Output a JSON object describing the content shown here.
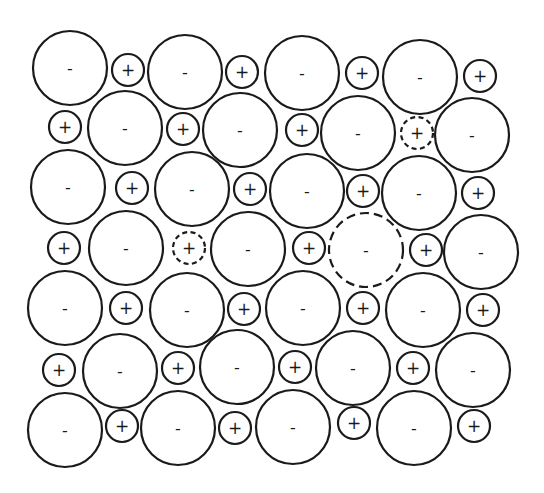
{
  "diagram": {
    "stroke_color": "#1a1a1a",
    "background": "#ffffff",
    "labels": {
      "anion": "-",
      "cation": "+"
    },
    "radii": {
      "anion": 37,
      "cation": 16
    },
    "ions": [
      {
        "x": 70,
        "y": 68,
        "type": "anion",
        "label": "-",
        "vacancy": false
      },
      {
        "x": 128,
        "y": 70,
        "type": "cation",
        "label": "+",
        "vacancy": false
      },
      {
        "x": 185,
        "y": 72,
        "type": "anion",
        "label": "-",
        "vacancy": false
      },
      {
        "x": 242,
        "y": 72,
        "type": "cation",
        "label": "+",
        "vacancy": false
      },
      {
        "x": 302,
        "y": 73,
        "type": "anion",
        "label": "-",
        "vacancy": false
      },
      {
        "x": 362,
        "y": 73,
        "type": "cation",
        "label": "+",
        "vacancy": false
      },
      {
        "x": 420,
        "y": 77,
        "type": "anion",
        "label": "-",
        "vacancy": false
      },
      {
        "x": 480,
        "y": 76,
        "type": "cation",
        "label": "+",
        "vacancy": false
      },
      {
        "x": 65,
        "y": 127,
        "type": "cation",
        "label": "+",
        "vacancy": false
      },
      {
        "x": 125,
        "y": 128,
        "type": "anion",
        "label": "-",
        "vacancy": false
      },
      {
        "x": 183,
        "y": 129,
        "type": "cation",
        "label": "+",
        "vacancy": false
      },
      {
        "x": 240,
        "y": 130,
        "type": "anion",
        "label": "-",
        "vacancy": false
      },
      {
        "x": 302,
        "y": 130,
        "type": "cation",
        "label": "+",
        "vacancy": false
      },
      {
        "x": 358,
        "y": 133,
        "type": "anion",
        "label": "-",
        "vacancy": false
      },
      {
        "x": 417,
        "y": 133,
        "type": "cation",
        "label": "+",
        "vacancy": true
      },
      {
        "x": 472,
        "y": 135,
        "type": "anion",
        "label": "-",
        "vacancy": false
      },
      {
        "x": 68,
        "y": 187,
        "type": "anion",
        "label": "-",
        "vacancy": false
      },
      {
        "x": 132,
        "y": 188,
        "type": "cation",
        "label": "+",
        "vacancy": false
      },
      {
        "x": 192,
        "y": 189,
        "type": "anion",
        "label": "-",
        "vacancy": false
      },
      {
        "x": 250,
        "y": 189,
        "type": "cation",
        "label": "+",
        "vacancy": false
      },
      {
        "x": 307,
        "y": 191,
        "type": "anion",
        "label": "-",
        "vacancy": false
      },
      {
        "x": 363,
        "y": 191,
        "type": "cation",
        "label": "+",
        "vacancy": false
      },
      {
        "x": 419,
        "y": 193,
        "type": "anion",
        "label": "-",
        "vacancy": false
      },
      {
        "x": 478,
        "y": 193,
        "type": "cation",
        "label": "+",
        "vacancy": false
      },
      {
        "x": 64,
        "y": 248,
        "type": "cation",
        "label": "+",
        "vacancy": false
      },
      {
        "x": 126,
        "y": 248,
        "type": "anion",
        "label": "-",
        "vacancy": false
      },
      {
        "x": 189,
        "y": 248,
        "type": "cation",
        "label": "+",
        "vacancy": true
      },
      {
        "x": 248,
        "y": 249,
        "type": "anion",
        "label": "-",
        "vacancy": false
      },
      {
        "x": 309,
        "y": 248,
        "type": "cation",
        "label": "+",
        "vacancy": false
      },
      {
        "x": 366,
        "y": 250,
        "type": "anion",
        "label": "-",
        "vacancy": true
      },
      {
        "x": 426,
        "y": 250,
        "type": "cation",
        "label": "+",
        "vacancy": false
      },
      {
        "x": 481,
        "y": 252,
        "type": "anion",
        "label": "-",
        "vacancy": false
      },
      {
        "x": 65,
        "y": 308,
        "type": "anion",
        "label": "-",
        "vacancy": false
      },
      {
        "x": 126,
        "y": 308,
        "type": "cation",
        "label": "+",
        "vacancy": false
      },
      {
        "x": 187,
        "y": 310,
        "type": "anion",
        "label": "-",
        "vacancy": false
      },
      {
        "x": 244,
        "y": 309,
        "type": "cation",
        "label": "+",
        "vacancy": false
      },
      {
        "x": 303,
        "y": 308,
        "type": "anion",
        "label": "-",
        "vacancy": false
      },
      {
        "x": 363,
        "y": 308,
        "type": "cation",
        "label": "+",
        "vacancy": false
      },
      {
        "x": 423,
        "y": 310,
        "type": "anion",
        "label": "-",
        "vacancy": false
      },
      {
        "x": 483,
        "y": 310,
        "type": "cation",
        "label": "+",
        "vacancy": false
      },
      {
        "x": 59,
        "y": 370,
        "type": "cation",
        "label": "+",
        "vacancy": false
      },
      {
        "x": 120,
        "y": 371,
        "type": "anion",
        "label": "-",
        "vacancy": false
      },
      {
        "x": 178,
        "y": 368,
        "type": "cation",
        "label": "+",
        "vacancy": false
      },
      {
        "x": 237,
        "y": 367,
        "type": "anion",
        "label": "-",
        "vacancy": false
      },
      {
        "x": 295,
        "y": 367,
        "type": "cation",
        "label": "+",
        "vacancy": false
      },
      {
        "x": 353,
        "y": 368,
        "type": "anion",
        "label": "-",
        "vacancy": false
      },
      {
        "x": 413,
        "y": 368,
        "type": "cation",
        "label": "+",
        "vacancy": false
      },
      {
        "x": 473,
        "y": 370,
        "type": "anion",
        "label": "-",
        "vacancy": false
      },
      {
        "x": 65,
        "y": 430,
        "type": "anion",
        "label": "-",
        "vacancy": false
      },
      {
        "x": 122,
        "y": 426,
        "type": "cation",
        "label": "+",
        "vacancy": false
      },
      {
        "x": 178,
        "y": 428,
        "type": "anion",
        "label": "-",
        "vacancy": false
      },
      {
        "x": 235,
        "y": 428,
        "type": "cation",
        "label": "+",
        "vacancy": false
      },
      {
        "x": 293,
        "y": 427,
        "type": "anion",
        "label": "-",
        "vacancy": false
      },
      {
        "x": 354,
        "y": 423,
        "type": "cation",
        "label": "+",
        "vacancy": false
      },
      {
        "x": 414,
        "y": 428,
        "type": "anion",
        "label": "-",
        "vacancy": false
      },
      {
        "x": 474,
        "y": 426,
        "type": "cation",
        "label": "+",
        "vacancy": false
      }
    ]
  }
}
